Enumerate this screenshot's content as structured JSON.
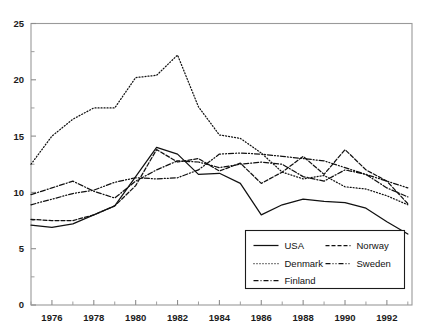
{
  "chart_data": {
    "type": "line",
    "title": "",
    "subtitle": "",
    "xlabel": "",
    "ylabel": "",
    "xlim": [
      1975,
      1993.2
    ],
    "ylim": [
      0,
      25
    ],
    "grid": false,
    "legend_position": "bottom-right",
    "x_tick_labels": [
      "1976",
      "1978",
      "1980",
      "1982",
      "1984",
      "1986",
      "1988",
      "1990",
      "1992"
    ],
    "x_tick_values": [
      1976,
      1978,
      1980,
      1982,
      1984,
      1986,
      1988,
      1990,
      1992
    ],
    "x_minor_tick_values": [
      1975,
      1977,
      1979,
      1981,
      1983,
      1985,
      1987,
      1989,
      1991,
      1993
    ],
    "y_tick_labels": [
      "0",
      "5",
      "10",
      "15",
      "20",
      "25"
    ],
    "y_tick_values": [
      0,
      5,
      10,
      15,
      20,
      25
    ],
    "y_minor_tick_values": [
      2.5,
      7.5,
      12.5,
      17.5,
      22.5
    ],
    "x": [
      1975,
      1976,
      1977,
      1978,
      1979,
      1980,
      1981,
      1982,
      1983,
      1984,
      1985,
      1986,
      1987,
      1988,
      1989,
      1990,
      1991,
      1992,
      1993
    ],
    "series": [
      {
        "name": "USA",
        "style": "solid",
        "dash": "none",
        "values": [
          7.1,
          6.9,
          7.2,
          8.0,
          8.8,
          11.4,
          14.0,
          13.4,
          11.6,
          11.7,
          10.8,
          8.0,
          8.9,
          9.4,
          9.2,
          9.1,
          8.6,
          7.4,
          6.3
        ]
      },
      {
        "name": "Denmark",
        "style": "dotted",
        "dash": "1,2",
        "values": [
          12.5,
          15.0,
          16.5,
          17.5,
          17.5,
          20.2,
          20.4,
          22.2,
          17.6,
          15.1,
          14.8,
          13.5,
          11.8,
          11.2,
          11.5,
          10.5,
          10.3,
          9.7,
          8.9
        ]
      },
      {
        "name": "Finland",
        "style": "dash-dot",
        "dash": "5,2,1,2",
        "values": [
          9.8,
          10.4,
          11.0,
          10.1,
          9.5,
          11.0,
          12.0,
          12.8,
          12.7,
          12.2,
          12.5,
          12.7,
          12.5,
          11.4,
          11.0,
          12.0,
          11.6,
          10.4,
          9.6
        ]
      },
      {
        "name": "Norway",
        "style": "dashed",
        "dash": "4,2",
        "values": [
          7.6,
          7.5,
          7.5,
          8.0,
          8.8,
          10.6,
          13.8,
          12.7,
          13.0,
          11.9,
          12.6,
          10.8,
          11.8,
          13.2,
          11.6,
          13.8,
          12.0,
          11.0,
          9.0
        ]
      },
      {
        "name": "Sweden",
        "style": "dash-dot-dot",
        "dash": "5,2,1,2,1,2",
        "values": [
          8.9,
          9.4,
          9.9,
          10.2,
          10.9,
          11.3,
          11.2,
          11.3,
          12.0,
          13.4,
          13.5,
          13.4,
          13.2,
          13.0,
          12.8,
          12.2,
          11.6,
          11.0,
          10.4
        ]
      }
    ],
    "legend": {
      "entries": [
        {
          "label": "USA",
          "dash": "none"
        },
        {
          "label": "Norway",
          "dash": "4,2"
        },
        {
          "label": "Denmark",
          "dash": "1,2"
        },
        {
          "label": "Sweden",
          "dash": "5,2,1,2,1,2"
        },
        {
          "label": "Finland",
          "dash": "5,2,1,2"
        }
      ]
    },
    "colors": {
      "line": "#111111",
      "axis": "#8d8d8d",
      "text": "#1b1b1b",
      "background": "#ffffff"
    }
  }
}
